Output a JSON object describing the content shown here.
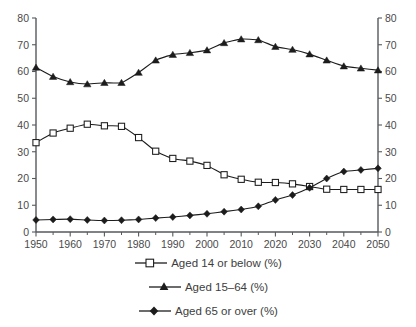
{
  "chart_data": {
    "type": "line",
    "title": "",
    "subtitle": "",
    "xlabel": "",
    "ylabel": "",
    "xlim": [
      1950,
      2050
    ],
    "ylim": [
      0,
      80
    ],
    "ytick_step": 10,
    "xtick_step": 10,
    "x_minor_step": 5,
    "grid": false,
    "dual_y_axis": true,
    "legend_position": "bottom",
    "x": [
      1950,
      1955,
      1960,
      1965,
      1970,
      1975,
      1980,
      1985,
      1990,
      1995,
      2000,
      2005,
      2010,
      2015,
      2020,
      2025,
      2030,
      2035,
      2040,
      2045,
      2050
    ],
    "xticklabels": [
      "1950",
      "1960",
      "1970",
      "1980",
      "1990",
      "2000",
      "2010",
      "2020",
      "2030",
      "2040",
      "2050"
    ],
    "yticklabels_left": [
      "0",
      "10",
      "20",
      "30",
      "40",
      "50",
      "60",
      "70",
      "80"
    ],
    "yticklabels_right": [
      "0",
      "10",
      "20",
      "30",
      "40",
      "50",
      "60",
      "70",
      "80"
    ],
    "series": [
      {
        "name": "Aged 14 or below (%)",
        "marker": "open-square",
        "color": "#1c1c1c",
        "values": [
          33.4,
          37.0,
          38.8,
          40.3,
          39.7,
          39.5,
          35.3,
          30.2,
          27.5,
          26.5,
          24.9,
          21.4,
          19.7,
          18.6,
          18.5,
          18.0,
          17.0,
          16.0,
          15.9,
          15.9,
          15.9
        ]
      },
      {
        "name": "Aged 15–64 (%)",
        "marker": "filled-triangle",
        "color": "#1c1c1c",
        "values": [
          61.5,
          58.1,
          56.1,
          55.3,
          55.8,
          55.8,
          59.6,
          64.2,
          66.3,
          67.0,
          68.0,
          70.7,
          72.1,
          71.8,
          69.3,
          68.2,
          66.5,
          64.2,
          62.0,
          61.2,
          60.5
        ]
      },
      {
        "name": "Aged 65 or over (%)",
        "marker": "filled-diamond",
        "color": "#1c1c1c",
        "values": [
          4.5,
          4.7,
          4.8,
          4.5,
          4.3,
          4.4,
          4.7,
          5.2,
          5.6,
          6.2,
          6.8,
          7.6,
          8.4,
          9.6,
          12.0,
          13.8,
          16.5,
          20.0,
          22.6,
          23.2,
          23.8
        ]
      }
    ]
  },
  "legend": {
    "items": [
      {
        "label": "Aged 14 or below (%)",
        "marker": "open-square"
      },
      {
        "label": "Aged 15–64 (%)",
        "marker": "filled-triangle"
      },
      {
        "label": "Aged 65 or over (%)",
        "marker": "filled-diamond"
      }
    ]
  }
}
